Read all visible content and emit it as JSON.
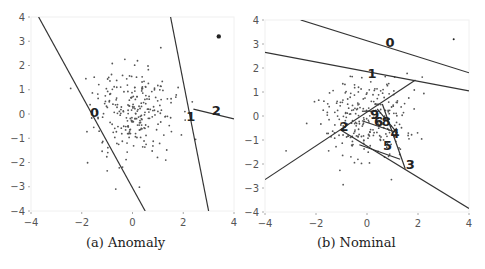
{
  "chart_data": [
    {
      "type": "scatter",
      "title": "(a) Anomaly",
      "xlim": [
        -4,
        4
      ],
      "ylim": [
        -4,
        4
      ],
      "xticks": [
        "-4",
        "-2",
        "0",
        "2",
        "4"
      ],
      "yticks": [
        "4",
        "3",
        "2",
        "1",
        "0",
        "-1",
        "-2",
        "-3",
        "-4"
      ],
      "grid": false,
      "anomaly_point": [
        3.4,
        3.2
      ],
      "cluster": {
        "center": [
          0,
          0
        ],
        "std": 0.9,
        "count": 256
      },
      "lines": [
        {
          "label": "0",
          "from": [
            -3.7,
            4.0
          ],
          "to": [
            0.5,
            -4.0
          ],
          "label_at": [
            -1.5,
            0.1
          ]
        },
        {
          "label": "1",
          "from": [
            1.5,
            4.0
          ],
          "to": [
            3.0,
            -4.0
          ],
          "label_at": [
            2.3,
            -0.1
          ]
        },
        {
          "label": "2",
          "from": [
            2.4,
            0.2
          ],
          "to": [
            4.0,
            -0.2
          ],
          "label_at": [
            3.3,
            0.15
          ]
        }
      ]
    },
    {
      "type": "scatter",
      "title": "(b) Nominal",
      "xlim": [
        -4,
        4
      ],
      "ylim": [
        -4,
        4
      ],
      "xticks": [
        "-4",
        "-2",
        "0",
        "2",
        "4"
      ],
      "yticks": [
        "4",
        "3",
        "2",
        "1",
        "0",
        "-1",
        "-2",
        "-3",
        "-4"
      ],
      "grid": false,
      "nominal_point": [
        3.4,
        3.2
      ],
      "cluster": {
        "center": [
          0,
          0
        ],
        "std": 0.9,
        "count": 256
      },
      "lines": [
        {
          "label": "0",
          "from": [
            -2.6,
            4.0
          ],
          "to": [
            4.0,
            1.8
          ],
          "label_at": [
            0.9,
            3.1
          ]
        },
        {
          "label": "1",
          "from": [
            -4.0,
            2.65
          ],
          "to": [
            4.0,
            1.05
          ],
          "label_at": [
            0.2,
            1.8
          ]
        },
        {
          "label": "2",
          "from": [
            -4.0,
            -2.65
          ],
          "to": [
            1.9,
            1.5
          ],
          "label_at": [
            -0.9,
            -0.4
          ]
        },
        {
          "label": "3",
          "from": [
            -1.0,
            -0.6
          ],
          "to": [
            4.0,
            -3.85
          ],
          "label_at": [
            1.7,
            -2.0
          ]
        },
        {
          "label": "4",
          "from": [
            0.6,
            0.5
          ],
          "to": [
            1.5,
            -2.2
          ],
          "label_at": [
            1.1,
            -0.7
          ]
        },
        {
          "label": "5",
          "from": [
            -0.3,
            -1.2
          ],
          "to": [
            1.3,
            -1.8
          ],
          "label_at": [
            0.8,
            -1.2
          ]
        },
        {
          "label": "6",
          "from": [
            -0.2,
            -0.2
          ],
          "to": [
            1.2,
            -0.7
          ],
          "label_at": [
            0.45,
            -0.2
          ]
        },
        {
          "label": "8",
          "from": [
            0.4,
            0.3
          ],
          "to": [
            1.1,
            -0.6
          ],
          "label_at": [
            0.75,
            -0.2
          ]
        },
        {
          "label": "9",
          "from": [
            -0.2,
            0.2
          ],
          "to": [
            0.5,
            0.2
          ],
          "label_at": [
            0.3,
            0.1
          ]
        }
      ]
    }
  ],
  "captions": {
    "a": "(a) Anomaly",
    "b": "(b) Nominal"
  }
}
